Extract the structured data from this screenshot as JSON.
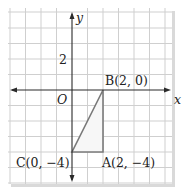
{
  "diagram": {
    "type": "coordinate-plane",
    "axes": {
      "x_label": "x",
      "y_label": "y",
      "origin_label": "O",
      "tick_label_y": "2"
    },
    "grid": {
      "cell_units": 1,
      "x_range": [
        -4,
        6
      ],
      "y_range": [
        -6,
        5
      ],
      "line_color": "#cfcfcf",
      "shadow_color": "#d8d8d8"
    },
    "triangle": {
      "vertices": [
        {
          "name": "A",
          "x": 2,
          "y": -4,
          "label": "A(2, −4)"
        },
        {
          "name": "B",
          "x": 2,
          "y": 0,
          "label": "B(2, 0)"
        },
        {
          "name": "C",
          "x": 0,
          "y": -4,
          "label": "C(0, −4)"
        }
      ],
      "stroke_color": "#7a7a7a",
      "fill_color": "#f7f7f7"
    },
    "colors": {
      "axis": "#2a2a2a",
      "text": "#222222"
    }
  }
}
